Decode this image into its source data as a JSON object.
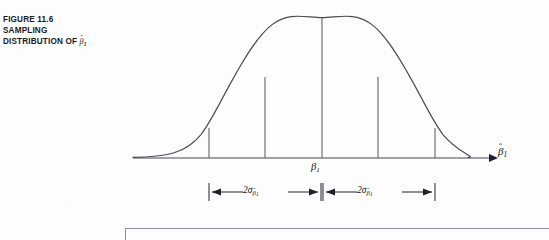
{
  "figure": {
    "caption_lines": [
      "FIGURE 11.6",
      "SAMPLING",
      "DISTRIBUTION OF"
    ],
    "caption_symbol": {
      "base": "β",
      "hat": "ˆ",
      "subscript": "1"
    },
    "curve": {
      "type": "normal-distribution-bell-curve",
      "mean_label": "β",
      "mean_subscript": "1",
      "stroke_color": "#4a4a52",
      "peak_x": 322,
      "peak_y": 18,
      "baseline_y": 158,
      "left_start_x": 133,
      "right_end_x": 468
    },
    "axis": {
      "name": "horizontal-axis",
      "arrow_x": 492,
      "label_base": "β",
      "label_hat": "ˆ",
      "label_subscript": "1"
    },
    "center_label": {
      "base": "β",
      "subscript": "1"
    },
    "brackets": [
      {
        "name": "left-two-sigma-bracket",
        "label_prefix": "2",
        "label_sigma": "σ",
        "label_sub_base": "β",
        "label_sub_hat": "ˆ",
        "label_sub_index": "1",
        "start_x": 209,
        "end_x": 321,
        "y": 192
      },
      {
        "name": "right-two-sigma-bracket",
        "label_prefix": "2",
        "label_sigma": "σ",
        "label_sub_base": "β",
        "label_sub_hat": "ˆ",
        "label_sub_index": "1",
        "start_x": 323,
        "end_x": 435,
        "y": 192
      }
    ],
    "tick_lines": [
      {
        "name": "minus-two-sigma-tick",
        "x": 209,
        "top_y": 128
      },
      {
        "name": "minus-one-sigma-tick",
        "x": 265,
        "top_y": 77
      },
      {
        "name": "center-tick",
        "x": 322,
        "top_y": 18
      },
      {
        "name": "plus-one-sigma-tick",
        "x": 378,
        "top_y": 77
      },
      {
        "name": "plus-two-sigma-tick",
        "x": 435,
        "top_y": 128
      }
    ]
  },
  "colors": {
    "page_background": "#fdfdfd",
    "ink": "#141414",
    "curve_stroke": "#4a4a52",
    "rule_gray": "#8c8c94"
  }
}
